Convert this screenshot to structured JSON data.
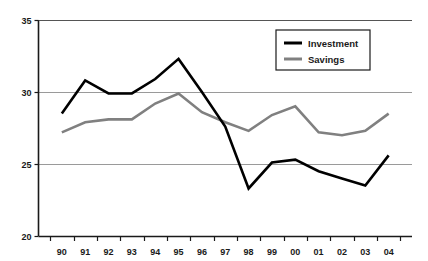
{
  "chart_data": {
    "type": "line",
    "title": "",
    "subtitle": "",
    "xlabel": "",
    "ylabel": "",
    "grid": true,
    "gridlines_y": [
      25,
      30,
      35
    ],
    "legend_position": "top-right",
    "xlim": [
      0,
      15
    ],
    "ylim": [
      20,
      35
    ],
    "yticks": [
      20,
      25,
      30,
      35
    ],
    "ytick_labels": [
      "20",
      "25",
      "30",
      "35"
    ],
    "categories": [
      "90",
      "91",
      "92",
      "93",
      "94",
      "95",
      "96",
      "97",
      "98",
      "99",
      "00",
      "01",
      "02",
      "03",
      "04"
    ],
    "series": [
      {
        "name": "Investment",
        "color": "#000000",
        "width": 2.6,
        "values": [
          28.5,
          30.8,
          29.9,
          29.9,
          30.9,
          32.3,
          30.0,
          27.6,
          23.3,
          25.1,
          25.3,
          24.5,
          24.0,
          23.5,
          25.6
        ]
      },
      {
        "name": "Savings",
        "color": "#808080",
        "width": 2.6,
        "values": [
          27.2,
          27.9,
          28.1,
          28.1,
          29.2,
          29.9,
          28.6,
          27.9,
          27.3,
          28.4,
          29.0,
          27.2,
          27.0,
          27.3,
          28.5
        ]
      }
    ]
  },
  "axes": {
    "y_tick_labels": [
      "35",
      "30",
      "25",
      "20"
    ],
    "x_tick_labels": [
      "90",
      "91",
      "92",
      "93",
      "94",
      "95",
      "96",
      "97",
      "98",
      "99",
      "00",
      "01",
      "02",
      "03",
      "04"
    ]
  },
  "legend": {
    "items": [
      {
        "label": "Investment",
        "color": "#000000"
      },
      {
        "label": "Savings",
        "color": "#808080"
      }
    ]
  },
  "colors": {
    "investment": "#000000",
    "savings": "#808080",
    "axis": "#1a1a1a",
    "gridline": "#9a9a9a",
    "background": "#ffffff",
    "text": "#1a1a1a"
  }
}
